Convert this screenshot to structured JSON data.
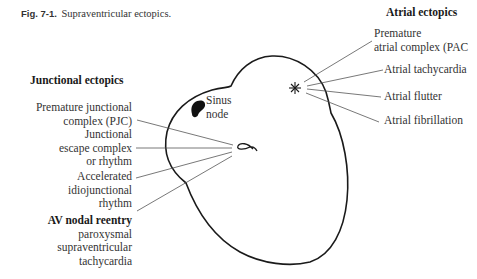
{
  "caption": {
    "figure_number": "Fig. 7-1.",
    "title": "Supraventricular ectopics."
  },
  "atrial": {
    "heading": "Atrial ectopics",
    "items": [
      {
        "line1": "Premature",
        "line2": "atrial complex (PAC"
      },
      {
        "line1": "Atrial tachycardia"
      },
      {
        "line1": "Atrial flutter"
      },
      {
        "line1": "Atrial fibrillation"
      }
    ]
  },
  "junctional": {
    "heading": "Junctional ectopics",
    "items": [
      {
        "line1": "Premature junctional",
        "line2": "complex (PJC)"
      },
      {
        "line1": "Junctional",
        "line2": "escape complex",
        "line3": "or rhythm"
      },
      {
        "line1": "Accelerated",
        "line2": "idiojunctional",
        "line3": "rhythm"
      }
    ]
  },
  "av_nodal": {
    "heading": "AV nodal reentry",
    "line1": "paroxysmal",
    "line2": "supraventricular",
    "line3": "tachycardia"
  },
  "sinus_node": {
    "line1": "Sinus",
    "line2": "node"
  },
  "symbols": {
    "atrial_focus": "asterisk-icon",
    "av_node": "av-node-icon",
    "sinus_node": "sinus-node-blob"
  }
}
